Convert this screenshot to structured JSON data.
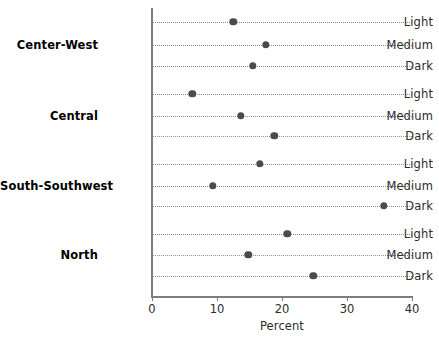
{
  "chart_data": {
    "type": "scatter",
    "title": "",
    "xlabel": "Percent",
    "ylabel": "",
    "xlim": [
      0,
      40
    ],
    "xticks": [
      0,
      10,
      20,
      30,
      40
    ],
    "xtick_labels": [
      "0",
      "10",
      "20",
      "30",
      "40"
    ],
    "grid": true,
    "legend": "none",
    "groups": [
      {
        "label": "Center-West",
        "categories": [
          "Light",
          "Medium",
          "Dark"
        ],
        "values": [
          12.5,
          17.5,
          15.5
        ]
      },
      {
        "label": "Central",
        "categories": [
          "Light",
          "Medium",
          "Dark"
        ],
        "values": [
          6.2,
          13.7,
          18.8
        ]
      },
      {
        "label": "South-Southwest",
        "categories": [
          "Light",
          "Medium",
          "Dark"
        ],
        "values": [
          16.6,
          9.4,
          35.7
        ]
      },
      {
        "label": "North",
        "categories": [
          "Light",
          "Medium",
          "Dark"
        ],
        "values": [
          20.8,
          14.8,
          24.8
        ]
      }
    ],
    "marker_color": "#4a4a4a",
    "axis_color": "#7d7d7d",
    "grid_color": "#8c8c8c"
  }
}
